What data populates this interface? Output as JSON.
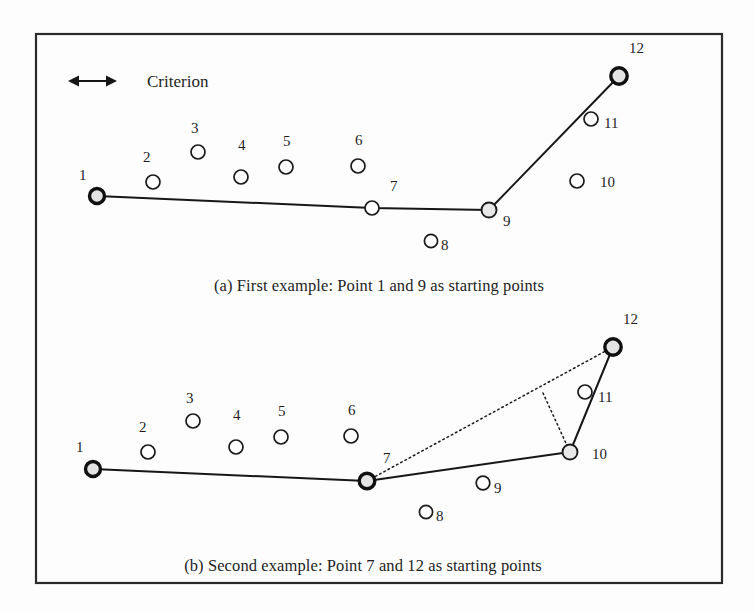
{
  "figure": {
    "background_color": "#fdfdfd",
    "frame_color": "#2b2b2b",
    "line_color": "#171717",
    "marker_fill_plain": "#ffffff",
    "marker_fill_vertex": "#e8e8e8",
    "frame": {
      "x": 36,
      "y": 34,
      "width": 686,
      "height": 549
    }
  },
  "legend": {
    "criterion_label": "Criterion",
    "arrow": {
      "x1": 68,
      "x2": 117,
      "y": 81
    },
    "label_x": 147,
    "label_y": 87
  },
  "panel_a": {
    "caption": "(a) First example:  Point 1 and 9 as starting points",
    "caption_x": 379,
    "caption_y": 291,
    "points": [
      {
        "id": "1",
        "x": 97,
        "y": 196,
        "r": 7.5,
        "style": "anchor",
        "label": "1",
        "lx": 79,
        "ly": 180
      },
      {
        "id": "2",
        "x": 153,
        "y": 182,
        "r": 7.0,
        "style": "plain",
        "label": "2",
        "lx": 143,
        "ly": 162
      },
      {
        "id": "3",
        "x": 198,
        "y": 152,
        "r": 7.0,
        "style": "plain",
        "label": "3",
        "lx": 191,
        "ly": 133
      },
      {
        "id": "4",
        "x": 241,
        "y": 177,
        "r": 7.0,
        "style": "plain",
        "label": "4",
        "lx": 238,
        "ly": 150
      },
      {
        "id": "5",
        "x": 286,
        "y": 167,
        "r": 7.0,
        "style": "plain",
        "label": "5",
        "lx": 283,
        "ly": 146
      },
      {
        "id": "6",
        "x": 358,
        "y": 166,
        "r": 7.0,
        "style": "plain",
        "label": "6",
        "lx": 355,
        "ly": 145
      },
      {
        "id": "7",
        "x": 372,
        "y": 208,
        "r": 7.0,
        "style": "plain",
        "label": "7",
        "lx": 390,
        "ly": 191
      },
      {
        "id": "8",
        "x": 431,
        "y": 241,
        "r": 6.6,
        "style": "plain",
        "label": "8",
        "lx": 441,
        "ly": 250
      },
      {
        "id": "9",
        "x": 489,
        "y": 210,
        "r": 7.5,
        "style": "vertex",
        "label": "9",
        "lx": 503,
        "ly": 226
      },
      {
        "id": "10",
        "x": 577,
        "y": 181,
        "r": 7.0,
        "style": "plain",
        "label": "10",
        "lx": 600,
        "ly": 187
      },
      {
        "id": "11",
        "x": 591,
        "y": 119,
        "r": 7.0,
        "style": "plain",
        "label": "11",
        "lx": 604,
        "ly": 128
      },
      {
        "id": "12",
        "x": 619,
        "y": 76,
        "r": 8.2,
        "style": "anchor",
        "label": "12",
        "lx": 629,
        "ly": 53
      }
    ],
    "solid_path_ids": [
      "1",
      "7",
      "9",
      "12"
    ],
    "dotted_paths": []
  },
  "panel_b": {
    "caption": "(b) Second example:  Point 7 and 12 as starting points",
    "caption_x": 363,
    "caption_y": 571,
    "points": [
      {
        "id": "1",
        "x": 93,
        "y": 469,
        "r": 7.5,
        "style": "anchor",
        "label": "1",
        "lx": 76,
        "ly": 452
      },
      {
        "id": "2",
        "x": 148,
        "y": 452,
        "r": 7.0,
        "style": "plain",
        "label": "2",
        "lx": 139,
        "ly": 432
      },
      {
        "id": "3",
        "x": 193,
        "y": 421,
        "r": 7.0,
        "style": "plain",
        "label": "3",
        "lx": 186,
        "ly": 403
      },
      {
        "id": "4",
        "x": 236,
        "y": 447,
        "r": 7.0,
        "style": "plain",
        "label": "4",
        "lx": 233,
        "ly": 420
      },
      {
        "id": "5",
        "x": 281,
        "y": 437,
        "r": 7.0,
        "style": "plain",
        "label": "5",
        "lx": 278,
        "ly": 416
      },
      {
        "id": "6",
        "x": 351,
        "y": 436,
        "r": 7.0,
        "style": "plain",
        "label": "6",
        "lx": 348,
        "ly": 415
      },
      {
        "id": "7",
        "x": 367,
        "y": 481,
        "r": 7.8,
        "style": "anchor",
        "label": "7",
        "lx": 383,
        "ly": 463
      },
      {
        "id": "8",
        "x": 426,
        "y": 512,
        "r": 6.6,
        "style": "plain",
        "label": "8",
        "lx": 436,
        "ly": 521
      },
      {
        "id": "9",
        "x": 483,
        "y": 483,
        "r": 6.8,
        "style": "plain",
        "label": "9",
        "lx": 494,
        "ly": 493
      },
      {
        "id": "10",
        "x": 570,
        "y": 452,
        "r": 7.5,
        "style": "vertex",
        "label": "10",
        "lx": 592,
        "ly": 459
      },
      {
        "id": "11",
        "x": 585,
        "y": 392,
        "r": 7.0,
        "style": "plain",
        "label": "11",
        "lx": 598,
        "ly": 402
      },
      {
        "id": "12",
        "x": 613,
        "y": 347,
        "r": 8.2,
        "style": "anchor",
        "label": "12",
        "lx": 623,
        "ly": 324
      }
    ],
    "solid_path_ids": [
      "1",
      "7",
      "10",
      "12"
    ],
    "dotted_paths": [
      {
        "name": "chord-7-to-12",
        "pts": [
          [
            367,
            481
          ],
          [
            613,
            347
          ]
        ]
      },
      {
        "name": "perpendicular-to-point-10",
        "pts": [
          [
            543,
            393
          ],
          [
            570,
            452
          ]
        ]
      }
    ]
  }
}
